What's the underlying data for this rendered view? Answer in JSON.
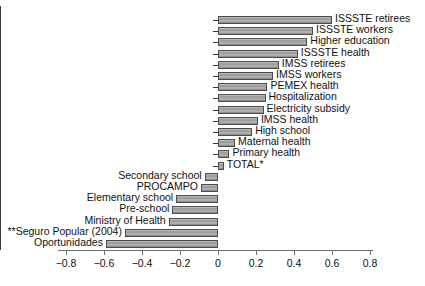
{
  "chart_data": {
    "type": "bar",
    "orientation": "horizontal",
    "title": "",
    "subtitle": "",
    "xlabel": "",
    "ylabel": "",
    "xlim": [
      -0.8,
      0.8
    ],
    "xticks": [
      -0.8,
      -0.6,
      -0.4,
      -0.2,
      0,
      0.2,
      0.4,
      0.6,
      0.8
    ],
    "xtick_labels": [
      "−0.8",
      "−0.6",
      "−0.4",
      "−0.2",
      "0",
      "0.2",
      "0.4",
      "0.6",
      "0.8"
    ],
    "grid": false,
    "legend": null,
    "categories": [
      "ISSSTE retirees",
      "ISSSTE workers",
      "Higher education",
      "ISSSTE health",
      "IMSS retirees",
      "IMSS workers",
      "PEMEX health",
      "Hospitalization",
      "Electricity subsidy",
      "IMSS health",
      "High school",
      "Maternal health",
      "Primary health",
      "TOTAL*",
      "Secondary school",
      "PROCAMPO",
      "Elementary school",
      "Pre-school",
      "Ministry of Health",
      "**Seguro Popular (2004)",
      "Oportunidades"
    ],
    "values": [
      0.6,
      0.5,
      0.47,
      0.42,
      0.32,
      0.29,
      0.26,
      0.25,
      0.24,
      0.21,
      0.18,
      0.09,
      0.06,
      0.03,
      -0.07,
      -0.09,
      -0.22,
      -0.24,
      -0.26,
      -0.49,
      -0.59
    ]
  },
  "footer": {
    "cut_off_text": ""
  }
}
